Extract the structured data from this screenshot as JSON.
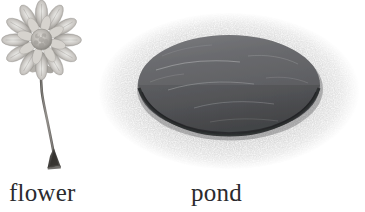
{
  "canvas": {
    "width": 365,
    "height": 212,
    "background_color": "#ffffff"
  },
  "items": [
    {
      "id": "flower",
      "label": "flower",
      "icon_name": "flower-illustration",
      "description": "grayscale daisy-like flower with many radiating petals, lumpy textured center disc, long S-curved stem ending in a dark triangular root wedge",
      "colors": {
        "petal_light": "#e3e1de",
        "petal_mid": "#b9b6b2",
        "petal_dark": "#8e8b87",
        "center_light": "#cfccc7",
        "center_dark": "#9a9792",
        "stem": "#7b7874",
        "root": "#4a4845"
      }
    },
    {
      "id": "pond",
      "label": "pond",
      "icon_name": "pond-illustration",
      "description": "dark gray elliptical water surface with faint light streaks, ringed by a speckled granular light-gray bank that fades at its outer edge",
      "colors": {
        "water_top": "#6f7073",
        "water_mid": "#5e5f62",
        "water_bottom": "#4b4c4f",
        "water_rim": "#2e2f31",
        "streak": "#c9cacb",
        "bank_speckle": "#9d9d9d",
        "bank_base": "#f2f2f2"
      }
    }
  ],
  "labels": {
    "flower": "flower",
    "pond": "pond",
    "text_color": "#2b2b2e"
  }
}
